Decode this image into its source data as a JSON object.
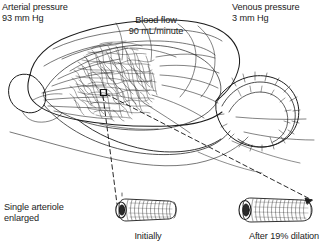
{
  "figure": {
    "type": "anatomical-diagram",
    "background_color": "#ffffff",
    "ink_color": "#1c1c1c"
  },
  "labels": {
    "arterial_pressure": "Arterial pressure\n93 mm Hg",
    "arterial_pressure_title": "Arterial pressure",
    "arterial_pressure_value": "93 mm Hg",
    "venous_pressure": "Venous pressure\n3 mm Hg",
    "venous_pressure_title": "Venous pressure",
    "venous_pressure_value": "3 mm Hg",
    "blood_flow": "Blood flow\n90 mL/minute",
    "blood_flow_title": "Blood flow",
    "blood_flow_value": "90 mL/minute",
    "single_arteriole": "Single arteriole\nenlarged",
    "initially": "Initially",
    "after_dilation": "After 19% dilation"
  },
  "measurements": {
    "arterial_pressure_mmhg": 93,
    "venous_pressure_mmhg": 3,
    "blood_flow_ml_per_minute": 90,
    "dilation_percent": 19
  },
  "parts": {
    "brain_outline": "brain-lateral-view",
    "cerebellum": "cerebellum-folia",
    "olfactory_bulb": "olfactory-bulb",
    "capillary_network": "dense-capillary-scribble",
    "site_marker": "small-square-marker",
    "tube_initial": "arteriole-initial",
    "tube_dilated": "arteriole-dilated"
  }
}
